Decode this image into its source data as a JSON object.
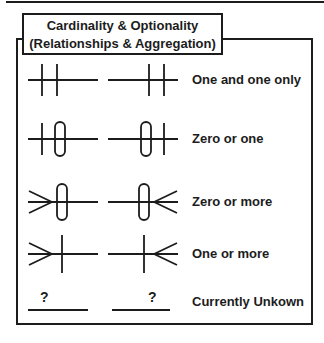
{
  "title": {
    "line1": "Cardinality & Optionality",
    "line2": "(Relationships & Aggregation)"
  },
  "legend_rows": [
    {
      "label": "One and one only",
      "left_symbol": "two-bars",
      "right_symbol": "two-bars-mirrored"
    },
    {
      "label": "Zero or one",
      "left_symbol": "bar-and-ring",
      "right_symbol": "bar-and-ring-mirrored"
    },
    {
      "label": "Zero or more",
      "left_symbol": "crow-foot-and-ring",
      "right_symbol": "crow-foot-and-ring-mirrored"
    },
    {
      "label": "One or more",
      "left_symbol": "crow-foot-and-bar",
      "right_symbol": "crow-foot-and-bar-mirrored"
    },
    {
      "label": "Currently Unkown",
      "left_symbol": "question-over-line",
      "right_symbol": "question-over-line-mirrored",
      "question_mark": "?"
    }
  ],
  "colors": {
    "line": "#1c1c1c",
    "background": "#ffffff"
  }
}
